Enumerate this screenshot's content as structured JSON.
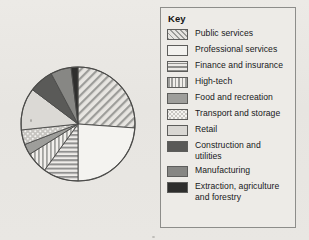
{
  "legend": {
    "title": "Key",
    "items": [
      {
        "label": "Public services",
        "pattern": "pat-diagonal",
        "swatch_name": "swatch-public-services"
      },
      {
        "label": "Professional services",
        "pattern": "pat-plain-light",
        "swatch_name": "swatch-professional-services"
      },
      {
        "label": "Finance and insurance",
        "pattern": "pat-horizontal",
        "swatch_name": "swatch-finance-and-insurance"
      },
      {
        "label": "High-tech",
        "pattern": "pat-vertical",
        "swatch_name": "swatch-high-tech"
      },
      {
        "label": "Food and recreation",
        "pattern": "pat-solid-mid",
        "swatch_name": "swatch-food-and-recreation"
      },
      {
        "label": "Transport and storage",
        "pattern": "pat-dots",
        "swatch_name": "swatch-transport-and-storage"
      },
      {
        "label": "Retail",
        "pattern": "pat-light-gray",
        "swatch_name": "swatch-retail"
      },
      {
        "label": "Construction and utilities",
        "pattern": "pat-dark-gray",
        "swatch_name": "swatch-construction-and-utilities"
      },
      {
        "label": "Manufacturing",
        "pattern": "pat-medium-gray",
        "swatch_name": "swatch-manufacturing"
      },
      {
        "label": "Extraction, agriculture",
        "label2": "and forestry",
        "pattern": "pat-near-black",
        "swatch_name": "swatch-extraction-agriculture-and-forestry"
      }
    ]
  },
  "chart_data": {
    "type": "pie",
    "title": "",
    "legend_position": "right",
    "start_angle_deg": 0,
    "direction": "clockwise",
    "labels": [
      "Public services",
      "Professional services",
      "Finance and insurance",
      "High-tech",
      "Food and recreation",
      "Transport and storage",
      "Retail",
      "Construction and utilities",
      "Manufacturing",
      "Extraction, agriculture and forestry"
    ],
    "values": [
      26,
      24,
      10,
      6,
      3,
      4,
      12,
      7,
      6,
      2
    ],
    "units": "percent",
    "slice_angles_deg": [
      {
        "label": "Public services",
        "start": 0,
        "end": 94
      },
      {
        "label": "Professional services",
        "start": 94,
        "end": 180
      },
      {
        "label": "Finance and insurance",
        "start": 180,
        "end": 216
      },
      {
        "label": "High-tech",
        "start": 216,
        "end": 238
      },
      {
        "label": "Food and recreation",
        "start": 238,
        "end": 249
      },
      {
        "label": "Transport and storage",
        "start": 249,
        "end": 264
      },
      {
        "label": "Retail",
        "start": 264,
        "end": 307
      },
      {
        "label": "Construction and utilities",
        "start": 307,
        "end": 332
      },
      {
        "label": "Manufacturing",
        "start": 332,
        "end": 353
      },
      {
        "label": "Extraction, agriculture and forestry",
        "start": 353,
        "end": 360
      }
    ],
    "geometry": {
      "cx": 64,
      "cy": 74,
      "r": 57
    },
    "pattern_keys": [
      "pat-diagonal",
      "pat-plain-light",
      "pat-horizontal",
      "pat-vertical",
      "pat-solid-mid",
      "pat-dots",
      "pat-light-gray",
      "pat-dark-gray",
      "pat-medium-gray",
      "pat-near-black"
    ],
    "fill_colors": [
      "#dedcd8",
      "#f3f2ef",
      "#e0ded9",
      "#e6e4e0",
      "#9e9e9b",
      "#c9c7c3",
      "#d9d7d3",
      "#595957",
      "#868683",
      "#2e2e2d"
    ],
    "outline_color": "#4a4a48",
    "grid": false
  }
}
